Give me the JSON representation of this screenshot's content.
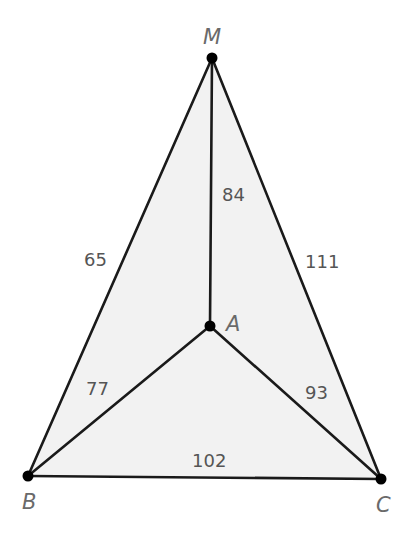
{
  "diagram": {
    "type": "graph",
    "colors": {
      "fill": "#f2f2f2",
      "edge": "#1a1a1a",
      "vertex": "#000000",
      "label": "#6a6a6a"
    },
    "vertices": [
      {
        "id": "M",
        "label": "M",
        "x": 212,
        "y": 58
      },
      {
        "id": "A",
        "label": "A",
        "x": 210,
        "y": 326
      },
      {
        "id": "B",
        "label": "B",
        "x": 28,
        "y": 476
      },
      {
        "id": "C",
        "label": "C",
        "x": 381,
        "y": 479
      }
    ],
    "edges": [
      {
        "from": "M",
        "to": "B",
        "weight": "65"
      },
      {
        "from": "M",
        "to": "C",
        "weight": "111"
      },
      {
        "from": "M",
        "to": "A",
        "weight": "84"
      },
      {
        "from": "A",
        "to": "B",
        "weight": "77"
      },
      {
        "from": "A",
        "to": "C",
        "weight": "93"
      },
      {
        "from": "B",
        "to": "C",
        "weight": "102"
      }
    ]
  }
}
